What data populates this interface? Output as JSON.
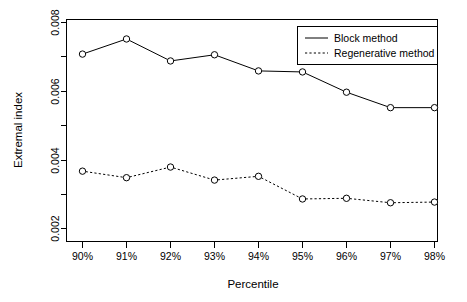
{
  "chart_data": {
    "type": "line",
    "title": "",
    "xlabel": "Percentile",
    "ylabel": "Extremal index",
    "categories": [
      "90%",
      "91%",
      "92%",
      "93%",
      "94%",
      "95%",
      "96%",
      "97%",
      "98%"
    ],
    "series": [
      {
        "name": "Block method",
        "linestyle": "solid",
        "marker": "open-circle",
        "color": "#000000",
        "values": [
          0.00708,
          0.00752,
          0.00688,
          0.00706,
          0.00659,
          0.00656,
          0.00597,
          0.00552,
          0.00552
        ]
      },
      {
        "name": "Regenerative method",
        "linestyle": "dotted",
        "marker": "open-circle",
        "color": "#000000",
        "values": [
          0.00367,
          0.00348,
          0.00379,
          0.00341,
          0.00352,
          0.00286,
          0.00288,
          0.00275,
          0.00277
        ]
      }
    ],
    "ylim": [
      0.0017,
      0.00805
    ],
    "y_tick_values": [
      0.002,
      0.003,
      0.004,
      0.005,
      0.006,
      0.007,
      0.008
    ],
    "y_tick_labels": [
      "0.002",
      "",
      "0.004",
      "",
      "0.006",
      "",
      "0.008"
    ],
    "x_tick_labels": [
      "90%",
      "91%",
      "92%",
      "93%",
      "94%",
      "95%",
      "96%",
      "97%",
      "98%"
    ],
    "grid": false,
    "legend_position": "top-right",
    "legend_entries": [
      "Block method",
      "Regenerative method"
    ]
  },
  "axes": {
    "x_title": "Percentile",
    "y_title": "Extremal index"
  },
  "legend": {
    "entry_0_label": "Block method",
    "entry_1_label": "Regenerative method"
  },
  "y_labels": {
    "t0": "0.002",
    "t1": "0.004",
    "t2": "0.006",
    "t3": "0.008"
  },
  "x_labels": {
    "t0": "90%",
    "t1": "91%",
    "t2": "92%",
    "t3": "93%",
    "t4": "94%",
    "t5": "95%",
    "t6": "96%",
    "t7": "97%",
    "t8": "98%"
  }
}
